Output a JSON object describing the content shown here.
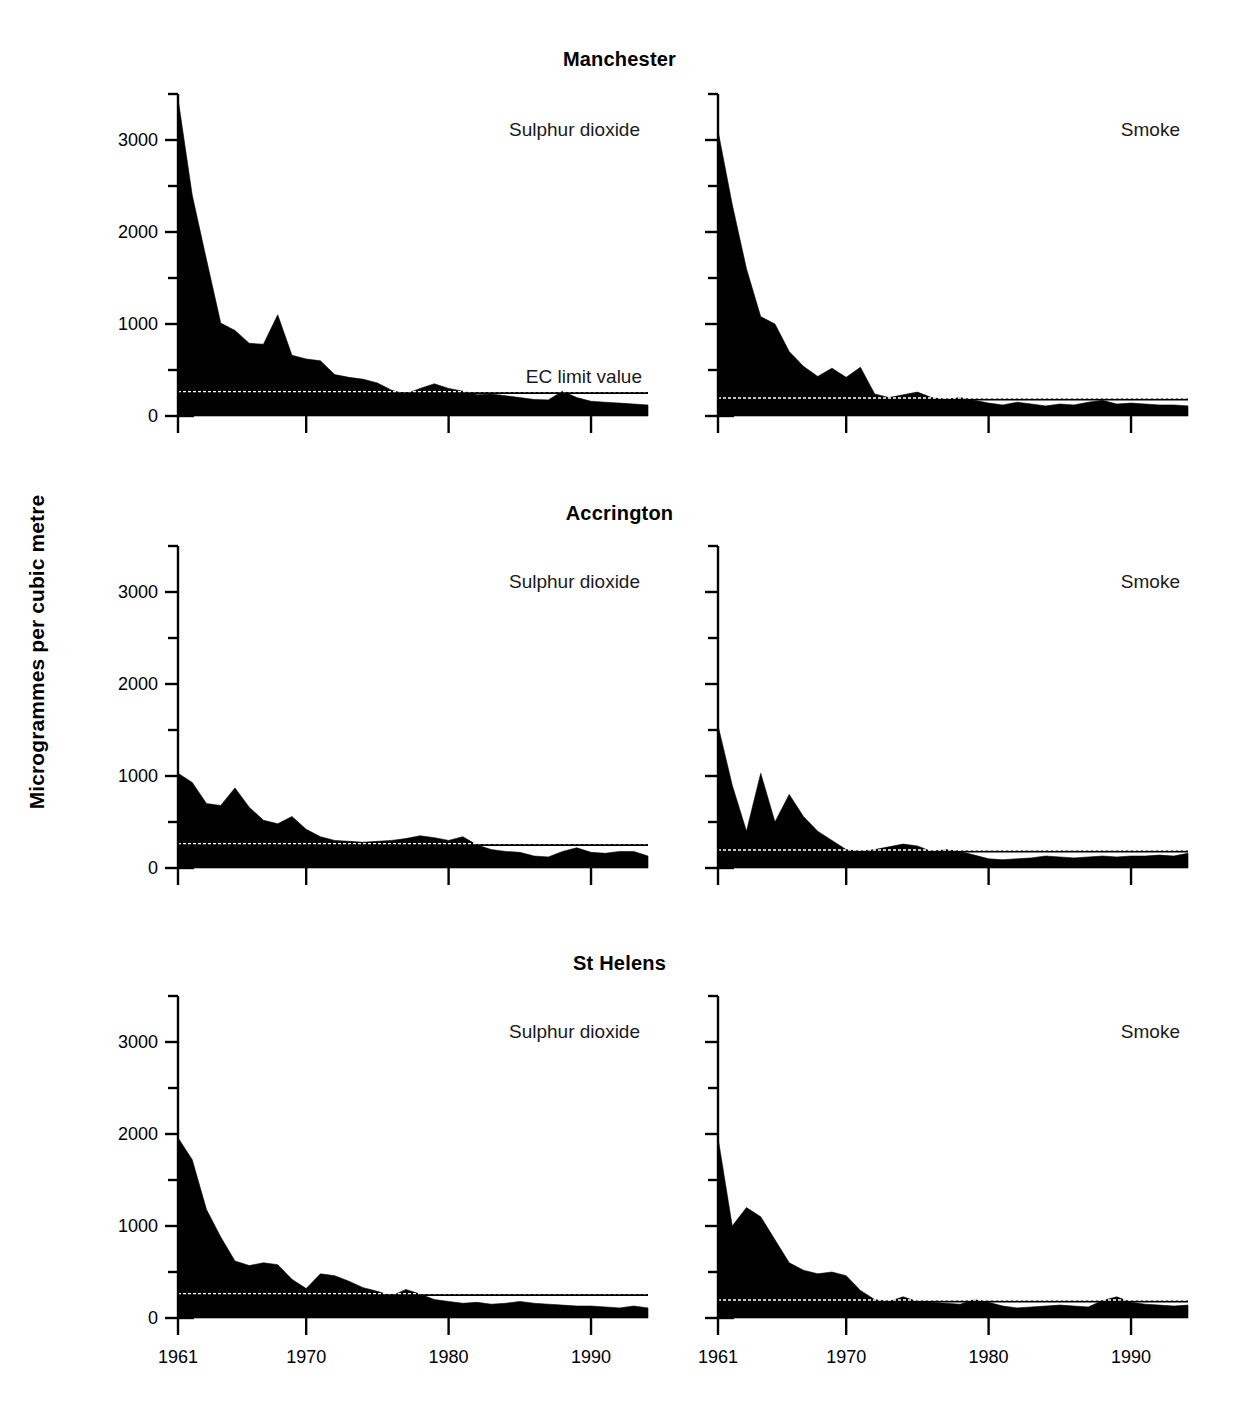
{
  "figure": {
    "ylabel": "Microgrammes per cubic metre",
    "ec_label": "EC limit value",
    "series_labels": {
      "so2": "Sulphur dioxide",
      "smoke": "Smoke"
    },
    "cities": [
      "Manchester",
      "Accrington",
      "St Helens"
    ]
  },
  "chart_data": {
    "type": "area",
    "title": "",
    "xlabel": "",
    "ylabel": "Microgrammes per cubic metre",
    "xlim": [
      1961,
      1994
    ],
    "ylim": [
      0,
      3500
    ],
    "grid": false,
    "legend": "none",
    "y_ticks_major": [
      0,
      1000,
      2000,
      3000
    ],
    "y_ticks_minor": [
      500,
      1500,
      2500,
      3500
    ],
    "y_tick_labels": [
      "0",
      "1000",
      "2000",
      "3000"
    ],
    "x_ticks": [
      1961,
      1970,
      1980,
      1990
    ],
    "x_tick_labels": [
      "1961",
      "1970",
      "1980",
      "1990"
    ],
    "annotations": [
      {
        "text": "EC limit value",
        "panel": "Manchester / Sulphur dioxide",
        "y": 250
      }
    ],
    "ec_limit_values": {
      "sulphur_dioxide": 250,
      "smoke": 180
    },
    "x": [
      1961,
      1962,
      1963,
      1964,
      1965,
      1966,
      1967,
      1968,
      1969,
      1970,
      1971,
      1972,
      1973,
      1974,
      1975,
      1976,
      1977,
      1978,
      1979,
      1980,
      1981,
      1982,
      1983,
      1984,
      1985,
      1986,
      1987,
      1988,
      1989,
      1990,
      1991,
      1992,
      1993,
      1994
    ],
    "panels": [
      {
        "city": "Manchester",
        "pollutant": "Sulphur dioxide",
        "fill_color": "#000000",
        "ec_limit": 250,
        "values": [
          3450,
          2400,
          1700,
          1010,
          930,
          790,
          780,
          1100,
          660,
          620,
          600,
          450,
          420,
          400,
          360,
          280,
          240,
          300,
          350,
          300,
          270,
          230,
          240,
          220,
          200,
          180,
          175,
          270,
          200,
          160,
          150,
          140,
          130,
          120
        ]
      },
      {
        "city": "Manchester",
        "pollutant": "Smoke",
        "fill_color": "#000000",
        "ec_limit": 180,
        "values": [
          3100,
          2300,
          1600,
          1080,
          1000,
          700,
          540,
          430,
          520,
          420,
          530,
          240,
          200,
          230,
          260,
          200,
          180,
          200,
          170,
          140,
          120,
          150,
          130,
          110,
          130,
          120,
          150,
          170,
          130,
          140,
          130,
          120,
          120,
          110
        ]
      },
      {
        "city": "Accrington",
        "pollutant": "Sulphur dioxide",
        "fill_color": "#000000",
        "ec_limit": 250,
        "values": [
          1030,
          930,
          700,
          680,
          870,
          660,
          520,
          480,
          560,
          420,
          340,
          300,
          290,
          280,
          290,
          300,
          320,
          350,
          330,
          300,
          340,
          250,
          200,
          180,
          170,
          130,
          120,
          180,
          220,
          170,
          160,
          180,
          180,
          130
        ]
      },
      {
        "city": "Accrington",
        "pollutant": "Smoke",
        "fill_color": "#000000",
        "ec_limit": 180,
        "values": [
          1550,
          900,
          400,
          1030,
          500,
          800,
          560,
          400,
          300,
          200,
          180,
          200,
          230,
          260,
          240,
          180,
          200,
          180,
          140,
          100,
          90,
          100,
          110,
          130,
          120,
          110,
          120,
          130,
          120,
          130,
          130,
          140,
          130,
          160
        ]
      },
      {
        "city": "St Helens",
        "pollutant": "Sulphur dioxide",
        "fill_color": "#000000",
        "ec_limit": 250,
        "values": [
          1960,
          1720,
          1180,
          880,
          620,
          570,
          600,
          580,
          420,
          320,
          480,
          460,
          400,
          330,
          290,
          240,
          310,
          260,
          200,
          180,
          160,
          170,
          150,
          160,
          180,
          160,
          150,
          140,
          130,
          130,
          120,
          110,
          130,
          110
        ]
      },
      {
        "city": "St Helens",
        "pollutant": "Smoke",
        "fill_color": "#000000",
        "ec_limit": 180,
        "values": [
          1960,
          1000,
          1200,
          1100,
          850,
          600,
          520,
          480,
          500,
          460,
          300,
          200,
          180,
          230,
          180,
          170,
          160,
          150,
          200,
          170,
          130,
          110,
          120,
          130,
          140,
          130,
          120,
          190,
          230,
          170,
          150,
          140,
          130,
          140
        ]
      }
    ]
  }
}
